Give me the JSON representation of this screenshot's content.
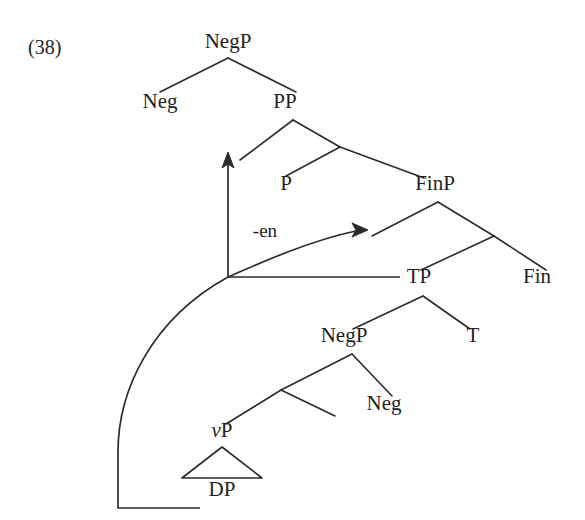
{
  "figure": {
    "example_number": "(38)",
    "bleed_text_above": "",
    "width": 585,
    "height": 520,
    "background_color": "#ffffff",
    "ink_color": "#2b2b2b"
  },
  "tree": {
    "nodes": [
      {
        "id": "negp-top",
        "label": "NegP",
        "x": 228,
        "y": 48,
        "italic_first_letter": false
      },
      {
        "id": "neg-top",
        "label": "Neg",
        "x": 160,
        "y": 108,
        "italic_first_letter": false
      },
      {
        "id": "pp",
        "label": "PP",
        "x": 285,
        "y": 108,
        "italic_first_letter": false
      },
      {
        "id": "p",
        "label": "P",
        "x": 286,
        "y": 190,
        "italic_first_letter": false
      },
      {
        "id": "finp",
        "label": "FinP",
        "x": 435,
        "y": 190,
        "italic_first_letter": false
      },
      {
        "id": "tp",
        "label": "TP",
        "x": 419,
        "y": 283,
        "italic_first_letter": false
      },
      {
        "id": "fin",
        "label": "Fin",
        "x": 537,
        "y": 283,
        "italic_first_letter": false
      },
      {
        "id": "negp-low",
        "label": "NegP",
        "x": 344,
        "y": 342,
        "italic_first_letter": false
      },
      {
        "id": "t",
        "label": "T",
        "x": 473,
        "y": 342,
        "italic_first_letter": false
      },
      {
        "id": "neg-low",
        "label": "Neg",
        "x": 384,
        "y": 410,
        "italic_first_letter": false
      },
      {
        "id": "vp",
        "label": "vP",
        "x": 222,
        "y": 437,
        "italic_first_letter": true
      },
      {
        "id": "dp",
        "label": "DP",
        "x": 222,
        "y": 496,
        "italic_first_letter": false
      }
    ],
    "affix_label": "-en",
    "affix_x": 265,
    "affix_y": 237,
    "branches": [
      {
        "from": "negp-top-apex",
        "x1": 228,
        "y1": 58,
        "x2": 160,
        "y2": 92
      },
      {
        "from": "negp-top-apex",
        "x1": 228,
        "y1": 58,
        "x2": 296,
        "y2": 92
      },
      {
        "from": "pp-apex",
        "x1": 293,
        "y1": 120,
        "x2": 240,
        "y2": 160
      },
      {
        "from": "pp-apex",
        "x1": 293,
        "y1": 120,
        "x2": 340,
        "y2": 147
      },
      {
        "from": "pbar",
        "x1": 340,
        "y1": 147,
        "x2": 286,
        "y2": 176
      },
      {
        "from": "pbar",
        "x1": 340,
        "y1": 147,
        "x2": 424,
        "y2": 178
      },
      {
        "from": "finp-apex",
        "x1": 438,
        "y1": 202,
        "x2": 372,
        "y2": 236
      },
      {
        "from": "finp-apex",
        "x1": 438,
        "y1": 202,
        "x2": 494,
        "y2": 236
      },
      {
        "from": "finbar",
        "x1": 494,
        "y1": 236,
        "x2": 421,
        "y2": 270
      },
      {
        "from": "finbar",
        "x1": 494,
        "y1": 236,
        "x2": 546,
        "y2": 270
      },
      {
        "from": "tp-apex",
        "x1": 423,
        "y1": 296,
        "x2": 353,
        "y2": 329
      },
      {
        "from": "tp-apex",
        "x1": 423,
        "y1": 296,
        "x2": 470,
        "y2": 329
      },
      {
        "from": "negp-low-apex",
        "x1": 352,
        "y1": 354,
        "x2": 281,
        "y2": 390
      },
      {
        "from": "negp-low-apex",
        "x1": 352,
        "y1": 354,
        "x2": 392,
        "y2": 396
      },
      {
        "from": "vbar",
        "x1": 281,
        "y1": 390,
        "x2": 226,
        "y2": 424
      },
      {
        "from": "vbar",
        "x1": 281,
        "y1": 390,
        "x2": 335,
        "y2": 416
      }
    ],
    "triangle": {
      "apex_x": 222,
      "apex_y": 447,
      "left_x": 182,
      "left_y": 478,
      "right_x": 262,
      "right_y": 478
    }
  },
  "movements": [
    {
      "id": "head-movement-to-p",
      "kind": "vertical-arrow",
      "path": "M 228 277 L 228 158",
      "arrowhead_x": 228,
      "arrowhead_y": 152,
      "arrowhead_direction": "up"
    },
    {
      "id": "phrasal-movement-to-finp-spec",
      "kind": "curved-arrow",
      "path": "M 228 277 C 262 262, 312 240, 356 231",
      "arrowhead_x": 368,
      "arrowhead_y": 230,
      "arrowhead_direction": "right"
    },
    {
      "id": "trace-connector-horizontal",
      "kind": "line",
      "path": "M 228 277 L 400 277"
    },
    {
      "id": "dp-long-movement",
      "kind": "curve-from-dp",
      "path": "M 200 508 L 118 508 L 118 452 C 118 392, 150 320, 228 277"
    }
  ]
}
